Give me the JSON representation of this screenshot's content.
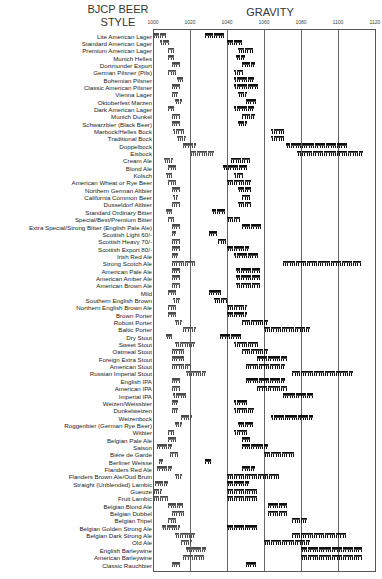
{
  "header": {
    "style_title_line1": "BJCP BEER",
    "style_title_line2": "STYLE",
    "gravity_title": "GRAVITY"
  },
  "axis": {
    "min": 1000,
    "max": 1120,
    "ticks": [
      1000,
      1020,
      1040,
      1060,
      1080,
      1100,
      1120
    ]
  },
  "colors": {
    "fg_marker": "#4a4a4a",
    "og_marker": "#0e0e0e",
    "grid": "#666666"
  },
  "chart_data": {
    "type": "range",
    "xlabel": "GRAVITY",
    "ylabel": "BJCP BEER STYLE",
    "xlim": [
      1000,
      1120
    ],
    "grid": true,
    "legend": "none (light glass clusters = final gravity range, dark glass clusters = original gravity range)",
    "categories": [
      "Lite American Lager",
      "Standard American Lager",
      "Premium American Lager",
      "Munich Helles",
      "Dortmunder Export",
      "German Pilsner (Pils)",
      "Bohemian Pilsner",
      "Classic American Pilsner",
      "Vienna Lager",
      "Oktoberfest Marzen",
      "Dark American Lager",
      "Munich Dunkel",
      "Schwarzbier (Black Beer)",
      "Marbock/Helles Bock",
      "Traditional Bock",
      "Doppelbock",
      "Eisbock",
      "Cream Ale",
      "Blond Ale",
      "Kolsch",
      "American Wheat or Rye Beer",
      "Northern German Altbier",
      "California Common Beer",
      "Dusseldorf Altbier",
      "Standard Ordinary Bitter",
      "Special/Best/Premium Bitter",
      "Extra Special/Strong Bitter (English Pale Ale)",
      "Scottish Light 60/-",
      "Scottish Heavy 70/-",
      "Scottish Export 80/-",
      "Irish Red Ale",
      "Strong Scotch Ale",
      "American Pale Ale",
      "American Amber Ale",
      "American Brown Ale",
      "Mild",
      "Southern English Brown",
      "Northern English Brown Ale",
      "Brown Porter",
      "Robust Porter",
      "Baltic Porter",
      "Dry Stout",
      "Sweet Stout",
      "Oatmeal Stout",
      "Foreign Extra Stout",
      "American Stout",
      "Russian Imperial Stout",
      "English IPA",
      "American IPA",
      "Imperial IPA",
      "Weizen/Weissbier",
      "Dunkelweizen",
      "Weizenbock",
      "Roggenbier (German Rye Beer)",
      "Witbier",
      "Belgian Pale Ale",
      "Saison",
      "Bière de Garde",
      "Berliner Weisse",
      "Flanders Red Ale",
      "Flanders Brown Ale/Oud Bruin",
      "Straight (Unblended) Lambic",
      "Gueuze",
      "Fruit Lambic",
      "Belgian Blond Ale",
      "Belgian Dubbel",
      "Belgian Tripel",
      "Belgian Golden Strong Ale",
      "Belgian Dark Strong Ale",
      "Old Ale",
      "English Barleywine",
      "American Barleywine",
      "Classic Rauchbier"
    ],
    "series": [
      {
        "name": "Final Gravity",
        "ranges": [
          [
            998,
            1008
          ],
          [
            1004,
            1010
          ],
          [
            1008,
            1012
          ],
          [
            1008,
            1012
          ],
          [
            1010,
            1015
          ],
          [
            1008,
            1013
          ],
          [
            1013,
            1017
          ],
          [
            1010,
            1015
          ],
          [
            1010,
            1014
          ],
          [
            1012,
            1016
          ],
          [
            1008,
            1012
          ],
          [
            1010,
            1016
          ],
          [
            1010,
            1016
          ],
          [
            1011,
            1018
          ],
          [
            1013,
            1019
          ],
          [
            1016,
            1024
          ],
          [
            1020,
            1035
          ],
          [
            1006,
            1012
          ],
          [
            1008,
            1013
          ],
          [
            1007,
            1011
          ],
          [
            1008,
            1013
          ],
          [
            1010,
            1015
          ],
          [
            1011,
            1014
          ],
          [
            1010,
            1015
          ],
          [
            1007,
            1011
          ],
          [
            1008,
            1012
          ],
          [
            1010,
            1016
          ],
          [
            1010,
            1013
          ],
          [
            1010,
            1015
          ],
          [
            1010,
            1016
          ],
          [
            1010,
            1014
          ],
          [
            1010,
            1025
          ],
          [
            1010,
            1015
          ],
          [
            1010,
            1015
          ],
          [
            1010,
            1016
          ],
          [
            1008,
            1013
          ],
          [
            1011,
            1015
          ],
          [
            1008,
            1013
          ],
          [
            1008,
            1014
          ],
          [
            1012,
            1016
          ],
          [
            1016,
            1024
          ],
          [
            1007,
            1011
          ],
          [
            1012,
            1024
          ],
          [
            1010,
            1018
          ],
          [
            1010,
            1018
          ],
          [
            1010,
            1022
          ],
          [
            1018,
            1030
          ],
          [
            1010,
            1015
          ],
          [
            1010,
            1015
          ],
          [
            1011,
            1020
          ],
          [
            1010,
            1014
          ],
          [
            1010,
            1014
          ],
          [
            1015,
            1022
          ],
          [
            1012,
            1016
          ],
          [
            1008,
            1012
          ],
          [
            1008,
            1014
          ],
          [
            1002,
            1012
          ],
          [
            1009,
            1014
          ],
          [
            1003,
            1006
          ],
          [
            1002,
            1012
          ],
          [
            1012,
            1016
          ],
          [
            1001,
            1010
          ],
          [
            1000,
            1006
          ],
          [
            1000,
            1010
          ],
          [
            1008,
            1018
          ],
          [
            1010,
            1018
          ],
          [
            1008,
            1014
          ],
          [
            1005,
            1016
          ],
          [
            1012,
            1024
          ],
          [
            1015,
            1022
          ],
          [
            1018,
            1030
          ],
          [
            1016,
            1030
          ],
          [
            1010,
            1016
          ]
        ]
      },
      {
        "name": "Original Gravity",
        "ranges": [
          [
            1028,
            1040
          ],
          [
            1040,
            1050
          ],
          [
            1046,
            1056
          ],
          [
            1045,
            1051
          ],
          [
            1048,
            1056
          ],
          [
            1044,
            1050
          ],
          [
            1044,
            1056
          ],
          [
            1044,
            1060
          ],
          [
            1046,
            1052
          ],
          [
            1050,
            1057
          ],
          [
            1044,
            1056
          ],
          [
            1048,
            1056
          ],
          [
            1046,
            1052
          ],
          [
            1064,
            1072
          ],
          [
            1064,
            1072
          ],
          [
            1072,
            1112
          ],
          [
            1078,
            1120
          ],
          [
            1042,
            1055
          ],
          [
            1038,
            1054
          ],
          [
            1044,
            1050
          ],
          [
            1040,
            1055
          ],
          [
            1046,
            1054
          ],
          [
            1048,
            1054
          ],
          [
            1046,
            1054
          ],
          [
            1032,
            1040
          ],
          [
            1040,
            1048
          ],
          [
            1048,
            1060
          ],
          [
            1030,
            1035
          ],
          [
            1035,
            1040
          ],
          [
            1040,
            1054
          ],
          [
            1044,
            1060
          ],
          [
            1070,
            1130
          ],
          [
            1045,
            1060
          ],
          [
            1045,
            1060
          ],
          [
            1045,
            1060
          ],
          [
            1030,
            1038
          ],
          [
            1033,
            1042
          ],
          [
            1040,
            1052
          ],
          [
            1040,
            1052
          ],
          [
            1048,
            1065
          ],
          [
            1060,
            1090
          ],
          [
            1036,
            1050
          ],
          [
            1044,
            1060
          ],
          [
            1048,
            1065
          ],
          [
            1056,
            1075
          ],
          [
            1050,
            1075
          ],
          [
            1075,
            1115
          ],
          [
            1050,
            1075
          ],
          [
            1056,
            1075
          ],
          [
            1070,
            1090
          ],
          [
            1044,
            1052
          ],
          [
            1044,
            1056
          ],
          [
            1064,
            1090
          ],
          [
            1046,
            1056
          ],
          [
            1044,
            1052
          ],
          [
            1048,
            1054
          ],
          [
            1048,
            1065
          ],
          [
            1060,
            1080
          ],
          [
            1028,
            1032
          ],
          [
            1048,
            1057
          ],
          [
            1040,
            1074
          ],
          [
            1040,
            1054
          ],
          [
            1040,
            1060
          ],
          [
            1040,
            1060
          ],
          [
            1062,
            1075
          ],
          [
            1062,
            1075
          ],
          [
            1075,
            1085
          ],
          [
            1040,
            1060
          ],
          [
            1075,
            1110
          ],
          [
            1060,
            1090
          ],
          [
            1080,
            1120
          ],
          [
            1080,
            1120
          ],
          [
            1050,
            1057
          ]
        ]
      }
    ]
  }
}
